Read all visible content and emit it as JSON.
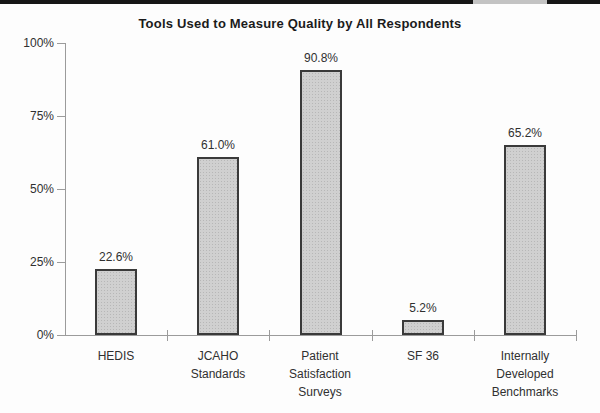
{
  "page": {
    "background": "#fdfdfd",
    "scan_bar_color": "#161616",
    "scan_bar_gap_color": "#c3c3c3"
  },
  "chart_data": {
    "type": "bar",
    "title": "Tools Used to Measure Quality by All Respondents",
    "categories": [
      "HEDIS",
      "JCAHO Standards",
      "Patient Satisfaction Surveys",
      "SF 36",
      "Internally Developed Benchmarks"
    ],
    "values": [
      22.6,
      61.0,
      90.8,
      5.2,
      65.2
    ],
    "bars": [
      {
        "slug": "hedis",
        "label": "HEDIS",
        "label_lines": [
          "HEDIS"
        ],
        "value": 22.6,
        "value_label": "22.6%"
      },
      {
        "slug": "jcaho-standards",
        "label": "JCAHO Standards",
        "label_lines": [
          "JCAHO",
          "Standards"
        ],
        "value": 61.0,
        "value_label": "61.0%"
      },
      {
        "slug": "patient-satisfaction-surveys",
        "label": "Patient Satisfaction Surveys",
        "label_lines": [
          "Patient",
          "Satisfaction",
          "Surveys"
        ],
        "value": 90.8,
        "value_label": "90.8%"
      },
      {
        "slug": "sf-36",
        "label": "SF 36",
        "label_lines": [
          "SF 36"
        ],
        "value": 5.2,
        "value_label": "5.2%"
      },
      {
        "slug": "internally-developed-benchmarks",
        "label": "Internally Developed Benchmarks",
        "label_lines": [
          "Internally",
          "Developed",
          "Benchmarks"
        ],
        "value": 65.2,
        "value_label": "65.2%"
      }
    ],
    "yticks": [
      {
        "value": 0,
        "label": "0%"
      },
      {
        "value": 25,
        "label": "25%"
      },
      {
        "value": 50,
        "label": "50%"
      },
      {
        "value": 75,
        "label": "75%"
      },
      {
        "value": 100,
        "label": "100%"
      }
    ],
    "ylim": [
      0,
      100
    ],
    "xlabel": "",
    "ylabel": "",
    "grid": false,
    "legend": null,
    "colors": {
      "bar_fill": "#d0d0d0",
      "bar_dot": "#b7b7b7",
      "bar_border": "#3a3a3a",
      "axis": "#9b9b9b",
      "text": "#303030",
      "title": "#1b1b1b",
      "background": "#fdfdfd",
      "scan_bar": "#161616",
      "scan_bar_gap": "#c3c3c3"
    }
  }
}
